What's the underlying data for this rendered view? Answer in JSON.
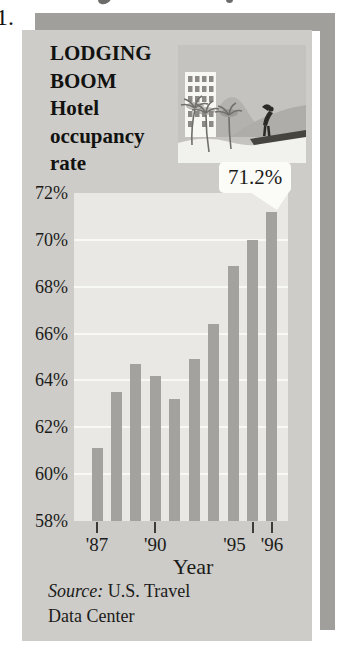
{
  "page": {
    "exercise_number": "1."
  },
  "infographic": {
    "title_lines": [
      "LODGING",
      "BOOM",
      "Hotel",
      "occupancy",
      "rate"
    ],
    "callout_label": "71.2%",
    "x_axis_title": "Year",
    "source_prefix": "Source:",
    "source_rest": " U.S. Travel",
    "source_line2": "Data Center"
  },
  "icons": {
    "illustration": "resort-hotel-scene-illustration"
  },
  "chart_data": {
    "type": "bar",
    "categories": [
      "'87",
      "'88",
      "'89",
      "'90",
      "'91",
      "'92",
      "'93",
      "'94",
      "'95",
      "'96"
    ],
    "values": [
      61.1,
      63.5,
      64.7,
      64.2,
      63.2,
      64.9,
      66.4,
      68.9,
      70.0,
      71.2
    ],
    "xlabel": "Year",
    "ylabel": "Hotel occupancy rate (%)",
    "ylim": [
      58,
      72
    ],
    "yticks": [
      {
        "value": 72,
        "label": "72%"
      },
      {
        "value": 70,
        "label": "70%"
      },
      {
        "value": 68,
        "label": "68%"
      },
      {
        "value": 66,
        "label": "66%"
      },
      {
        "value": 64,
        "label": "64%"
      },
      {
        "value": 62,
        "label": "62%"
      },
      {
        "value": 60,
        "label": "60%"
      },
      {
        "value": 58,
        "label": "58%"
      }
    ],
    "xticks_shown": [
      {
        "label": "'87",
        "index": 0
      },
      {
        "label": "'90",
        "index": 3
      },
      {
        "label": "'95",
        "index": 8
      },
      {
        "label": "'96",
        "index": 9
      }
    ],
    "annotation": {
      "text": "71.2%",
      "category": "'96"
    },
    "legend": null,
    "grid": true,
    "source": "Source: U.S. Travel Data Center"
  },
  "colors": {
    "page_bg": "#ffffff",
    "card_bg": "#cdccc9",
    "shadow": "#a09f9c",
    "plot_bg": "#e9e8e4",
    "gridline": "#f8f8f5",
    "bar": "#a3a29f",
    "text": "#1b1b19",
    "callout_bg": "#fbfbf8",
    "illustration_bg": "#c4c3c0"
  }
}
